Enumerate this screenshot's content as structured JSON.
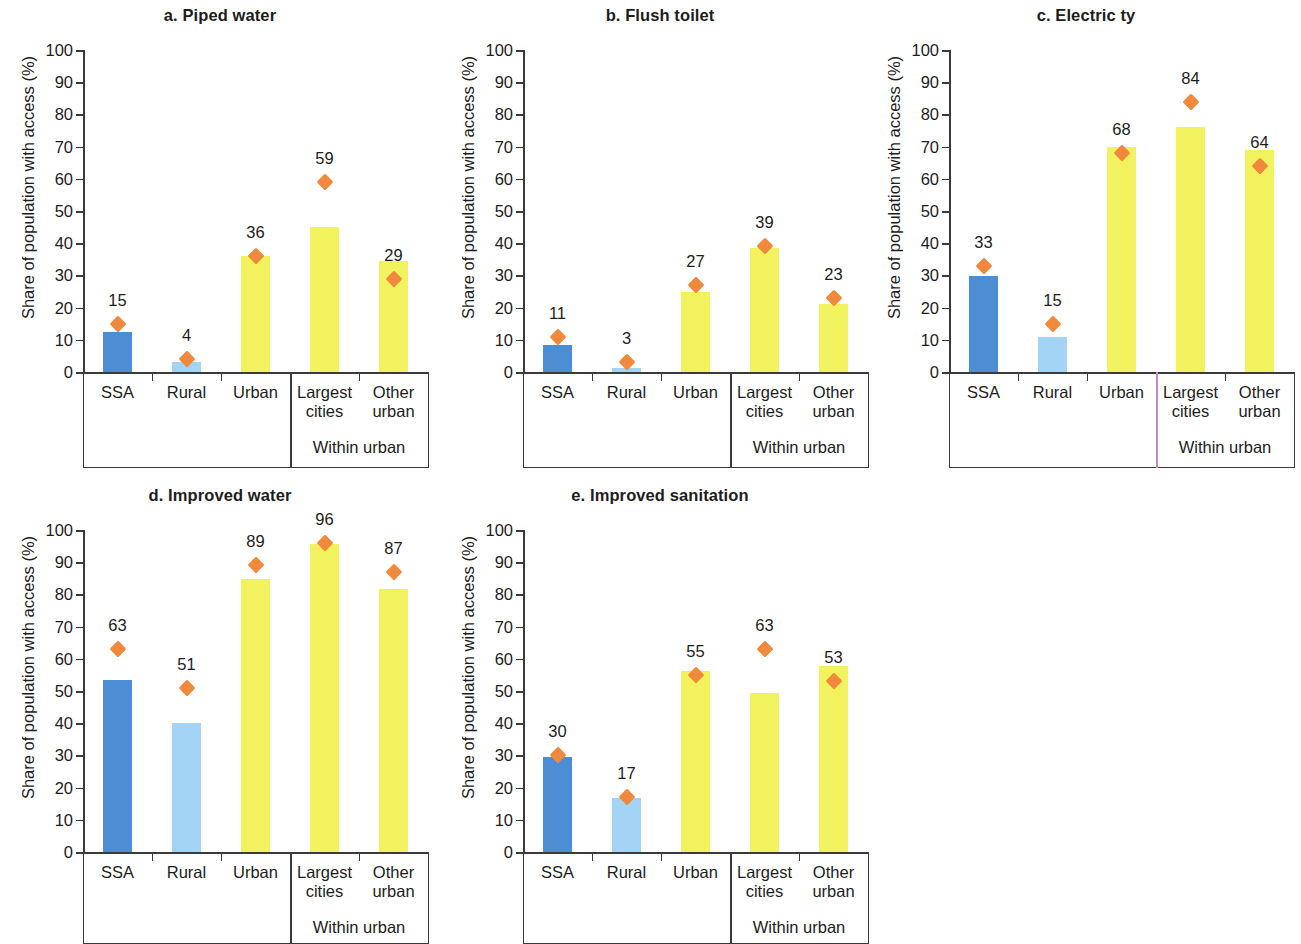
{
  "figure": {
    "y_axis_label": "Share of population with access (%)",
    "y_ticks": [
      "100",
      "90",
      "80",
      "70",
      "60",
      "50",
      "40",
      "30",
      "20",
      "10",
      "0"
    ],
    "categories": [
      "SSA",
      "Rural",
      "Urban",
      "Largest cities",
      "Other urban"
    ],
    "category_lines": [
      [
        "SSA"
      ],
      [
        "Rural"
      ],
      [
        "Urban"
      ],
      [
        "Largest",
        "cities"
      ],
      [
        "Other",
        "urban"
      ]
    ],
    "within_urban_label": "Within urban",
    "colors": {
      "ssa_bar": "#4d8dd4",
      "rural_bar": "#a3d4f5",
      "urban_bar": "#f2f25e",
      "marker": "#f0893c",
      "axis": "#3a3a38",
      "divider_pink": "#c58cc0"
    }
  },
  "chart_data": [
    {
      "type": "bar",
      "panel": "a",
      "title": "a. Piped water",
      "categories": [
        "SSA",
        "Rural",
        "Urban",
        "Largest cities",
        "Other urban"
      ],
      "values": [
        12.5,
        3,
        36,
        45,
        34.5
      ],
      "bar_colors": [
        "#4d8dd4",
        "#a3d4f5",
        "#f2f25e",
        "#f2f25e",
        "#f2f25e"
      ],
      "series": [
        {
          "name": "bar",
          "values": [
            12.5,
            3,
            36,
            45,
            34.5
          ]
        },
        {
          "name": "marker",
          "values": [
            15,
            4,
            36,
            59,
            29
          ],
          "labels": [
            "15",
            "4",
            "36",
            "59",
            "29"
          ]
        }
      ],
      "xlabel": "",
      "ylabel": "Share of population with access (%)",
      "ylim": [
        0,
        100
      ],
      "grid": false,
      "legend": "none"
    },
    {
      "type": "bar",
      "panel": "b",
      "title": "b. Flush toilet",
      "categories": [
        "SSA",
        "Rural",
        "Urban",
        "Largest cities",
        "Other urban"
      ],
      "values": [
        8.5,
        1.2,
        24.8,
        38.5,
        21
      ],
      "bar_colors": [
        "#4d8dd4",
        "#a3d4f5",
        "#f2f25e",
        "#f2f25e",
        "#f2f25e"
      ],
      "series": [
        {
          "name": "bar",
          "values": [
            8.5,
            1.2,
            24.8,
            38.5,
            21
          ]
        },
        {
          "name": "marker",
          "values": [
            11,
            3,
            27,
            39,
            23
          ],
          "labels": [
            "11",
            "3",
            "27",
            "39",
            "23"
          ]
        }
      ],
      "xlabel": "",
      "ylabel": "Share of population with access (%)",
      "ylim": [
        0,
        100
      ],
      "grid": false,
      "legend": "none"
    },
    {
      "type": "bar",
      "panel": "c",
      "title": "c. Electric ty",
      "categories": [
        "SSA",
        "Rural",
        "Urban",
        "Largest cities",
        "Other urban"
      ],
      "values": [
        29.8,
        11,
        70,
        76,
        69
      ],
      "bar_colors": [
        "#4d8dd4",
        "#a3d4f5",
        "#f2f25e",
        "#f2f25e",
        "#f2f25e"
      ],
      "series": [
        {
          "name": "bar",
          "values": [
            29.8,
            11,
            70,
            76,
            69
          ]
        },
        {
          "name": "marker",
          "values": [
            33,
            15,
            68,
            84,
            64
          ],
          "labels": [
            "33",
            "15",
            "68",
            "84",
            "64"
          ]
        }
      ],
      "xlabel": "",
      "ylabel": "Share of population with access (%)",
      "ylim": [
        0,
        100
      ],
      "grid": false,
      "legend": "none"
    },
    {
      "type": "bar",
      "panel": "d",
      "title": "d. Improved water",
      "categories": [
        "SSA",
        "Rural",
        "Urban",
        "Largest cities",
        "Other urban"
      ],
      "values": [
        53.5,
        40.2,
        84.8,
        95.5,
        81.8
      ],
      "bar_colors": [
        "#4d8dd4",
        "#a3d4f5",
        "#f2f25e",
        "#f2f25e",
        "#f2f25e"
      ],
      "series": [
        {
          "name": "bar",
          "values": [
            53.5,
            40.2,
            84.8,
            95.5,
            81.8
          ]
        },
        {
          "name": "marker",
          "values": [
            63,
            51,
            89,
            96,
            87
          ],
          "labels": [
            "63",
            "51",
            "89",
            "96",
            "87"
          ]
        }
      ],
      "xlabel": "",
      "ylabel": "Share of population with access (%)",
      "ylim": [
        0,
        100
      ],
      "grid": false,
      "legend": "none"
    },
    {
      "type": "bar",
      "panel": "e",
      "title": "e. Improved sanitation",
      "categories": [
        "SSA",
        "Rural",
        "Urban",
        "Largest cities",
        "Other urban"
      ],
      "values": [
        29.5,
        16.8,
        56.3,
        49.3,
        57.8
      ],
      "bar_colors": [
        "#4d8dd4",
        "#a3d4f5",
        "#f2f25e",
        "#f2f25e",
        "#f2f25e"
      ],
      "series": [
        {
          "name": "bar",
          "values": [
            29.5,
            16.8,
            56.3,
            49.3,
            57.8
          ]
        },
        {
          "name": "marker",
          "values": [
            30,
            17,
            55,
            63,
            53
          ],
          "labels": [
            "30",
            "17",
            "55",
            "63",
            "53"
          ]
        }
      ],
      "xlabel": "",
      "ylabel": "Share of population with access (%)",
      "ylim": [
        0,
        100
      ],
      "grid": false,
      "legend": "none"
    }
  ]
}
